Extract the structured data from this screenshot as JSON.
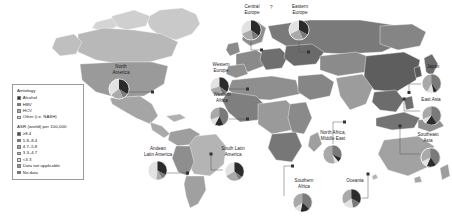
{
  "figure": {
    "type": "choropleth-world-map-with-pie-insets",
    "background": "#ffffff"
  },
  "legend": {
    "aetiology_title": "Aetiology",
    "aetiology_items": [
      {
        "label": "Alcohol",
        "color": "#2b2b2b"
      },
      {
        "label": "HBV",
        "color": "#7a7a7a"
      },
      {
        "label": "HCV",
        "color": "#a9a9a9"
      },
      {
        "label": "Other (i.e. NASH)",
        "color": "#e2e2e2"
      }
    ],
    "asr_title": "ASR (world) per 100,000",
    "asr_items": [
      {
        "label": "≥8.4",
        "color": "#4a4a4a"
      },
      {
        "label": "5.8–8.4",
        "color": "#7d7d7d"
      },
      {
        "label": "4.7–5.8",
        "color": "#9d9d9d"
      },
      {
        "label": "3.3–4.7",
        "color": "#bcbcbc"
      },
      {
        "label": "<3.3",
        "color": "#dddddd"
      },
      {
        "label": "Data not applicable",
        "color": "#8e8e8e"
      },
      {
        "label": "No data",
        "color": "#6f6f6f"
      }
    ]
  },
  "annotations": {
    "question_mark": "?"
  },
  "chart_data": {
    "type": "pie",
    "title": "",
    "legend_position": "left",
    "aetiology_categories": [
      "Alcohol",
      "HBV",
      "HCV",
      "Other (i.e. NASH)"
    ],
    "aetiology_colors": [
      "#2b2b2b",
      "#7a7a7a",
      "#a9a9a9",
      "#e2e2e2"
    ],
    "asr_bins": [
      "≥8.4",
      "5.8–8.4",
      "4.7–5.8",
      "3.3–4.7",
      "<3.3",
      "Data not applicable",
      "No data"
    ],
    "asr_bin_colors": [
      "#4a4a4a",
      "#7d7d7d",
      "#9d9d9d",
      "#bcbcbc",
      "#dddddd",
      "#8e8e8e",
      "#6f6f6f"
    ],
    "regions": [
      {
        "name": "North America",
        "label": "North\nAmerica",
        "values": [
          30,
          12,
          26,
          32
        ]
      },
      {
        "name": "Central Europe",
        "label": "Central\nEurope",
        "values": [
          36,
          20,
          30,
          14
        ]
      },
      {
        "name": "Eastern Europe",
        "label": "Eastern\nEurope",
        "values": [
          40,
          14,
          32,
          14
        ]
      },
      {
        "name": "Western Europe",
        "label": "Western\nEurope",
        "values": [
          32,
          13,
          40,
          15
        ]
      },
      {
        "name": "Japan",
        "label": "Japan",
        "values": [
          12,
          15,
          60,
          13
        ]
      },
      {
        "name": "East Asia",
        "label": "East Asia",
        "values": [
          16,
          56,
          18,
          10
        ]
      },
      {
        "name": "Western Africa",
        "label": "Western\nAfrica",
        "values": [
          10,
          60,
          20,
          10
        ]
      },
      {
        "name": "North Africa, Middle East",
        "label": "North Africa,\nMiddle East",
        "values": [
          10,
          30,
          48,
          12
        ]
      },
      {
        "name": "Southeast Asia",
        "label": "Southeast\nAsia",
        "values": [
          14,
          52,
          22,
          12
        ]
      },
      {
        "name": "Andean Latin America",
        "label": "Andean\nLatin America",
        "values": [
          22,
          18,
          18,
          42
        ]
      },
      {
        "name": "South Latin America",
        "label": "South Latin\nAmerica",
        "values": [
          26,
          14,
          34,
          26
        ]
      },
      {
        "name": "Southern Africa",
        "label": "Southern\nAfrica",
        "values": [
          18,
          40,
          28,
          14
        ]
      },
      {
        "name": "Oceania",
        "label": "Oceania",
        "values": [
          24,
          30,
          20,
          26
        ]
      }
    ]
  }
}
